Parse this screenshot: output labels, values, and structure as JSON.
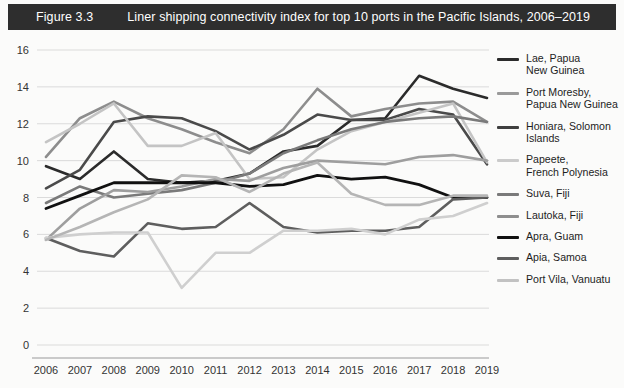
{
  "header": {
    "figure_number": "Figure 3.3",
    "title": "Liner shipping connectivity index for top 10 ports in the Pacific Islands, 2006–2019",
    "bar_color": "#2e2e2e",
    "text_color": "#ffffff"
  },
  "chart_data": {
    "type": "line",
    "title": "Liner shipping connectivity index for top 10 ports in the Pacific Islands, 2006–2019",
    "xlabel": "",
    "ylabel": "",
    "x": [
      2006,
      2007,
      2008,
      2009,
      2010,
      2011,
      2012,
      2013,
      2014,
      2015,
      2016,
      2017,
      2018,
      2019
    ],
    "categories": [
      "2006",
      "2007",
      "2008",
      "2009",
      "2010",
      "2011",
      "2012",
      "2013",
      "2014",
      "2015",
      "2016",
      "2017",
      "2018",
      "2019"
    ],
    "xlim": [
      2006,
      2019
    ],
    "ylim": [
      0,
      16
    ],
    "yticks": [
      0,
      2,
      4,
      6,
      8,
      10,
      12,
      14,
      16
    ],
    "grid": true,
    "legend_position": "right",
    "series": [
      {
        "name": "Lae, Papua New Guinea",
        "color": "#2b2b2b",
        "width": 2.6,
        "values": [
          9.7,
          9.0,
          10.5,
          9.0,
          8.8,
          8.9,
          9.3,
          10.5,
          10.8,
          12.2,
          12.3,
          14.6,
          13.9,
          13.4
        ]
      },
      {
        "name": "Port Moresby, Papua New Guinea",
        "color": "#8d8d8d",
        "width": 2.6,
        "values": [
          10.2,
          12.3,
          13.2,
          12.3,
          11.7,
          11.0,
          10.4,
          11.7,
          13.9,
          12.4,
          12.8,
          13.1,
          13.2,
          12.1
        ]
      },
      {
        "name": "Honiara, Solomon Islands",
        "color": "#4a4a4a",
        "width": 2.6,
        "values": [
          8.5,
          9.5,
          12.1,
          12.4,
          12.3,
          11.6,
          10.6,
          11.4,
          12.5,
          12.2,
          12.2,
          12.8,
          12.5,
          9.8
        ]
      },
      {
        "name": "Papeete, French Polynesia",
        "color": "#c4c4c4",
        "width": 2.6,
        "values": [
          11.0,
          12.0,
          13.1,
          10.8,
          10.8,
          11.5,
          9.0,
          9.1,
          10.6,
          11.6,
          12.1,
          12.6,
          13.1,
          9.9
        ]
      },
      {
        "name": "Suva, Fiji",
        "color": "#7a7a7a",
        "width": 2.6,
        "values": [
          7.7,
          8.6,
          8.0,
          8.2,
          8.4,
          8.8,
          9.3,
          10.4,
          11.1,
          11.7,
          12.1,
          12.3,
          12.4,
          12.1
        ]
      },
      {
        "name": "Lautoka, Fiji",
        "color": "#9e9e9e",
        "width": 2.6,
        "values": [
          5.7,
          7.4,
          8.4,
          8.3,
          8.6,
          9.0,
          8.9,
          9.6,
          10.0,
          9.9,
          9.8,
          10.2,
          10.3,
          10.0
        ]
      },
      {
        "name": "Apra, Guam",
        "color": "#111111",
        "width": 2.8,
        "values": [
          7.4,
          8.1,
          8.8,
          8.8,
          8.8,
          8.8,
          8.6,
          8.7,
          9.2,
          9.0,
          9.1,
          8.7,
          8.0,
          8.0
        ]
      },
      {
        "name": "Apia, Samoa",
        "color": "#5e5e5e",
        "width": 2.6,
        "values": [
          5.8,
          5.1,
          4.8,
          6.6,
          6.3,
          6.4,
          7.7,
          6.4,
          6.1,
          6.2,
          6.2,
          6.4,
          7.9,
          8.0
        ]
      },
      {
        "name": "Port Vila, Vanuatu",
        "color": "#cfcfcf",
        "width": 2.6,
        "values": [
          5.8,
          6.0,
          6.1,
          6.1,
          3.1,
          5.0,
          5.0,
          6.2,
          6.2,
          6.3,
          6.0,
          6.8,
          7.0,
          7.7
        ]
      },
      {
        "name": "series-10",
        "color": "#b5b5b5",
        "width": 2.6,
        "values": [
          5.7,
          6.4,
          7.2,
          7.9,
          9.2,
          9.1,
          8.3,
          9.3,
          9.9,
          8.2,
          7.6,
          7.6,
          8.1,
          8.1
        ]
      }
    ]
  },
  "legend": {
    "items": [
      {
        "label": "Lae, Papua\nNew Guinea",
        "color": "#2b2b2b"
      },
      {
        "label": "Port Moresby,\nPapua New Guinea",
        "color": "#9a9a9a"
      },
      {
        "label": "Honiara, Solomon\nIslands",
        "color": "#3f3f3f"
      },
      {
        "label": "Papeete,\nFrench Polynesia",
        "color": "#cbcbcb"
      },
      {
        "label": "Suva, Fiji",
        "color": "#7a7a7a"
      },
      {
        "label": "Lautoka, Fiji",
        "color": "#8e8e8e"
      },
      {
        "label": "Apra, Guam",
        "color": "#111111"
      },
      {
        "label": "Apia, Samoa",
        "color": "#5e5e5e"
      },
      {
        "label": "Port Vila, Vanuatu",
        "color": "#c2c2c2"
      }
    ]
  },
  "axes": {
    "y_tick_labels": [
      "16",
      "14",
      "12",
      "10",
      "8",
      "6",
      "4",
      "2",
      "0"
    ],
    "x_tick_labels": [
      "2006",
      "2007",
      "2008",
      "2009",
      "2010",
      "2011",
      "2012",
      "2013",
      "2014",
      "2015",
      "2016",
      "2017",
      "2018",
      "2019"
    ]
  }
}
